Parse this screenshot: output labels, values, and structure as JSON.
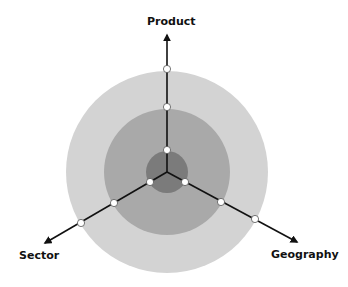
{
  "diagram": {
    "type": "three-axis concentric rings",
    "center": [
      167,
      172
    ],
    "rings": [
      {
        "name": "outer",
        "radius": 101,
        "color": "#d3d3d3"
      },
      {
        "name": "middle",
        "radius": 63,
        "color": "#a9a9a9"
      },
      {
        "name": "inner",
        "radius": 21,
        "color": "#7b7b7b"
      }
    ],
    "axes": [
      {
        "label": "Product",
        "tip": [
          167,
          33
        ]
      },
      {
        "label": "Sector",
        "tip": [
          43,
          244
        ]
      },
      {
        "label": "Geography",
        "tip": [
          299,
          243
        ]
      }
    ],
    "dot_color": "#ffffff",
    "line_color": "#111111"
  },
  "labels": {
    "product": "Product",
    "sector": "Sector",
    "geography": "Geography"
  }
}
